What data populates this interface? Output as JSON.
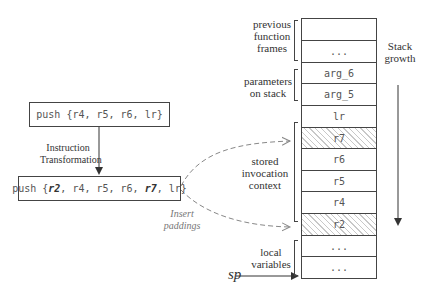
{
  "left": {
    "original_instruction": "push {r4, r5, r6, lr}",
    "transformed_instruction": {
      "prefix": "push {",
      "parts": [
        {
          "text": "r2",
          "emphasis": true
        },
        {
          "text": ", r4, r5, r6, ",
          "emphasis": false
        },
        {
          "text": "r7",
          "emphasis": true
        },
        {
          "text": ", lr}",
          "emphasis": false
        }
      ]
    },
    "transform_label_line1": "Instruction",
    "transform_label_line2": "Transformation",
    "padding_label_line1": "Insert",
    "padding_label_line2": "paddings"
  },
  "stack": {
    "cells": [
      {
        "text": "",
        "hatched": false
      },
      {
        "text": "...",
        "hatched": false
      },
      {
        "text": "arg_6",
        "hatched": false
      },
      {
        "text": "arg_5",
        "hatched": false
      },
      {
        "text": "lr",
        "hatched": false
      },
      {
        "text": "r7",
        "hatched": true
      },
      {
        "text": "r6",
        "hatched": false
      },
      {
        "text": "r5",
        "hatched": false
      },
      {
        "text": "r4",
        "hatched": false
      },
      {
        "text": "r2",
        "hatched": true
      },
      {
        "text": "...",
        "hatched": false
      },
      {
        "text": "...",
        "hatched": false
      }
    ],
    "groups": {
      "previous_frames": [
        "previous",
        "function",
        "frames"
      ],
      "parameters": [
        "parameters",
        "on stack"
      ],
      "context": [
        "stored",
        "invocation",
        "context"
      ],
      "locals": [
        "local",
        "variables"
      ]
    },
    "growth_label_line1": "Stack",
    "growth_label_line2": "growth",
    "sp_label": "sp"
  },
  "colors": {
    "line": "#444444",
    "dashed_arrow": "#888888",
    "hatch": "#c8c8c8"
  }
}
